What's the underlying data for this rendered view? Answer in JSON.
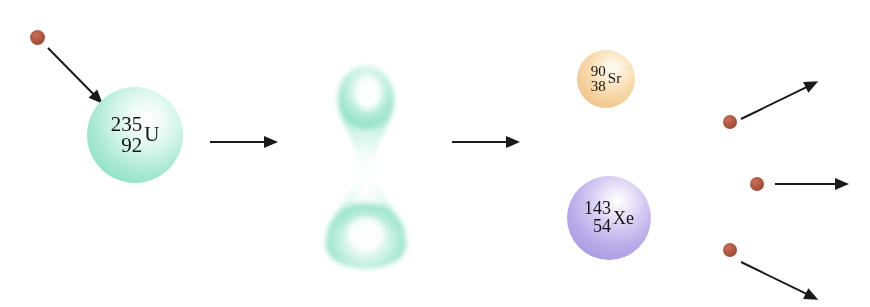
{
  "diagram": {
    "background_color": "#ffffff"
  },
  "colors": {
    "uranium": "#96e3c9",
    "strontium": "#eec289",
    "xenon": "#ab9ce2",
    "neutron": "#a8513f",
    "arrow": "#1a1a1a",
    "label_text": "#141414"
  },
  "nuclei": {
    "uranium": {
      "name": "uranium-235",
      "mass_number": "235",
      "atomic_number": "92",
      "symbol": "U"
    },
    "strontium": {
      "name": "strontium-90",
      "mass_number": "90",
      "atomic_number": "38",
      "symbol": "Sr"
    },
    "xenon": {
      "name": "xenon-143",
      "mass_number": "143",
      "atomic_number": "54",
      "symbol": "Xe"
    },
    "deformed": {
      "name": "deformed-compound-nucleus",
      "label": ""
    }
  },
  "neutrons": {
    "incoming": {
      "name": "incident-neutron"
    },
    "emitted": [
      {
        "name": "emitted-neutron-1"
      },
      {
        "name": "emitted-neutron-2"
      },
      {
        "name": "emitted-neutron-3"
      }
    ]
  },
  "arrows": {
    "incoming_neutron": {
      "name": "incident-neutron-arrow"
    },
    "stage_1_to_2": {
      "name": "fission-step-arrow-1"
    },
    "stage_2_to_3": {
      "name": "fission-step-arrow-2"
    },
    "emitted": [
      {
        "name": "emitted-neutron-arrow-up"
      },
      {
        "name": "emitted-neutron-arrow-right"
      },
      {
        "name": "emitted-neutron-arrow-down"
      }
    ]
  }
}
